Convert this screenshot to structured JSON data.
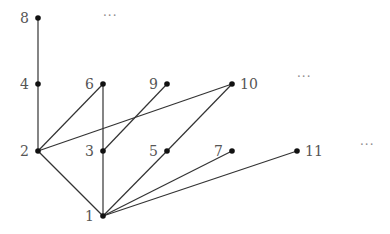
{
  "diagram": {
    "type": "hasse-diagram",
    "relation": "divisibility",
    "nodes": [
      {
        "id": "1",
        "label": "1",
        "x": 103,
        "y": 216,
        "label_side": "left"
      },
      {
        "id": "2",
        "label": "2",
        "x": 38,
        "y": 151,
        "label_side": "left"
      },
      {
        "id": "3",
        "label": "3",
        "x": 103,
        "y": 151,
        "label_side": "left"
      },
      {
        "id": "5",
        "label": "5",
        "x": 167,
        "y": 151,
        "label_side": "left"
      },
      {
        "id": "7",
        "label": "7",
        "x": 232,
        "y": 151,
        "label_side": "left"
      },
      {
        "id": "11",
        "label": "11",
        "x": 297,
        "y": 151,
        "label_side": "right"
      },
      {
        "id": "4",
        "label": "4",
        "x": 38,
        "y": 84,
        "label_side": "left"
      },
      {
        "id": "6",
        "label": "6",
        "x": 103,
        "y": 84,
        "label_side": "left"
      },
      {
        "id": "9",
        "label": "9",
        "x": 167,
        "y": 84,
        "label_side": "left"
      },
      {
        "id": "10",
        "label": "10",
        "x": 232,
        "y": 84,
        "label_side": "right"
      },
      {
        "id": "8",
        "label": "8",
        "x": 38,
        "y": 18,
        "label_side": "left"
      }
    ],
    "edges": [
      [
        "8",
        "4"
      ],
      [
        "4",
        "2"
      ],
      [
        "6",
        "2"
      ],
      [
        "6",
        "3"
      ],
      [
        "9",
        "3"
      ],
      [
        "10",
        "2"
      ],
      [
        "10",
        "5"
      ],
      [
        "2",
        "1"
      ],
      [
        "3",
        "1"
      ],
      [
        "5",
        "1"
      ],
      [
        "7",
        "1"
      ],
      [
        "11",
        "1"
      ]
    ],
    "ellipses": [
      {
        "text": "···",
        "x": 103,
        "y": 20
      },
      {
        "text": "···",
        "x": 297,
        "y": 81
      },
      {
        "text": "···",
        "x": 360,
        "y": 149
      }
    ]
  }
}
